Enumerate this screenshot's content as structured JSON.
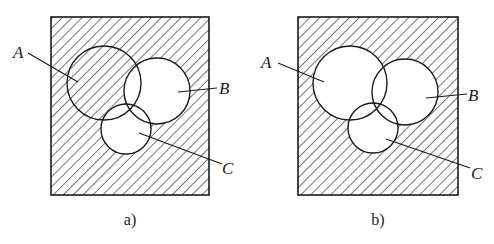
{
  "figure": {
    "colors": {
      "stroke": "#1a1a1a",
      "background": "#ffffff",
      "hatch": "#1a1a1a"
    },
    "panels": [
      {
        "id": "a",
        "caption": "a)",
        "frame": {
          "x": 51,
          "y": 17,
          "w": 158,
          "h": 178
        },
        "circles": [
          {
            "name": "A",
            "cx": 104,
            "cy": 83,
            "r": 37
          },
          {
            "name": "B",
            "cx": 157,
            "cy": 91,
            "r": 33
          },
          {
            "name": "C",
            "cx": 126,
            "cy": 129,
            "r": 25
          }
        ],
        "shaded_region": "Complement of (B ∪ C) — universe hatched including A, except where A overlaps B or C",
        "labels": [
          {
            "text": "A",
            "x": 13,
            "y": 58,
            "leader": [
              28,
              53,
              78,
              82
            ]
          },
          {
            "text": "B",
            "x": 219,
            "y": 94,
            "leader": [
              178,
              92,
              217,
              88
            ]
          },
          {
            "text": "C",
            "x": 222,
            "y": 174,
            "leader": [
              139,
              133,
              222,
              164
            ]
          }
        ]
      },
      {
        "id": "b",
        "caption": "b)",
        "frame": {
          "x": 298,
          "y": 17,
          "w": 160,
          "h": 178
        },
        "circles": [
          {
            "name": "A",
            "cx": 350,
            "cy": 83,
            "r": 37
          },
          {
            "name": "B",
            "cx": 405,
            "cy": 92,
            "r": 33
          },
          {
            "name": "C",
            "cx": 373,
            "cy": 128,
            "r": 25
          }
        ],
        "shaded_region": "Complement of (A ∪ B ∪ C) — only area outside all circles hatched",
        "labels": [
          {
            "text": "A",
            "x": 261,
            "y": 68,
            "leader": [
              278,
              63,
              324,
              82
            ]
          },
          {
            "text": "B",
            "x": 468,
            "y": 101,
            "leader": [
              426,
              98,
              467,
              94
            ]
          },
          {
            "text": "C",
            "x": 471,
            "y": 179,
            "leader": [
              386,
              139,
              470,
              168
            ]
          }
        ]
      }
    ]
  }
}
